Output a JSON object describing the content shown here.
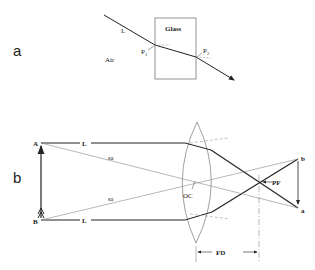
{
  "panel_a": {
    "label": "a",
    "glass_label": "Glass",
    "air_label": "Air",
    "ray_label": "L",
    "point1_label": "P",
    "point1_sub": "1",
    "point2_label": "P",
    "point2_sub": "2"
  },
  "panel_b": {
    "label": "b",
    "point_A": "A",
    "point_B": "B",
    "ray_top_label": "L",
    "ray_bottom_label": "L",
    "secondary_axis_top": "sa",
    "secondary_axis_bottom": "sa",
    "optical_center": "OC",
    "principal_focus": "PF",
    "focal_distance": "FD",
    "image_top": "b",
    "image_bottom": "a"
  },
  "colors": {
    "line": "#222222",
    "thin": "#777777",
    "text": "#222222"
  }
}
